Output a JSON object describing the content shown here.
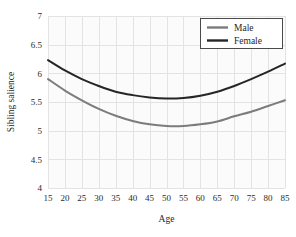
{
  "chart_data": {
    "type": "line",
    "title": "",
    "xlabel": "Age",
    "ylabel": "Sibling salience",
    "xlim": [
      15,
      85
    ],
    "ylim": [
      4,
      7
    ],
    "xticks": [
      15,
      20,
      25,
      30,
      35,
      40,
      45,
      50,
      55,
      60,
      65,
      70,
      75,
      80,
      85
    ],
    "xticklabels": [
      "15",
      "20",
      "25",
      "30",
      "35",
      "40",
      "45",
      "50",
      "55",
      "60",
      "65",
      "70",
      "75",
      "80",
      "85"
    ],
    "yticks": [
      4,
      4.5,
      5,
      5.5,
      6,
      6.5,
      7
    ],
    "yticklabels": [
      "4",
      "4.5",
      "5",
      "5.5",
      "6",
      "6.5",
      "7"
    ],
    "grid": true,
    "legend_position": "top-right",
    "x": [
      15,
      20,
      25,
      30,
      35,
      40,
      45,
      50,
      55,
      60,
      65,
      70,
      75,
      80,
      85
    ],
    "series": [
      {
        "name": "Male",
        "color": "#7c7c7c",
        "values": [
          5.9,
          5.7,
          5.53,
          5.38,
          5.26,
          5.17,
          5.11,
          5.08,
          5.08,
          5.11,
          5.16,
          5.25,
          5.33,
          5.43,
          5.53
        ]
      },
      {
        "name": "Female",
        "color": "#262626",
        "values": [
          6.23,
          6.05,
          5.9,
          5.78,
          5.68,
          5.62,
          5.58,
          5.56,
          5.57,
          5.61,
          5.68,
          5.78,
          5.9,
          6.03,
          6.17
        ]
      }
    ]
  },
  "axes": {
    "x_title": "Age",
    "y_title": "Sibling salience"
  },
  "legend": {
    "entries": [
      {
        "label": "Male",
        "color": "#7c7c7c"
      },
      {
        "label": "Female",
        "color": "#262626"
      }
    ]
  },
  "colors": {
    "male_line": "#7c7c7c",
    "female_line": "#262626",
    "grid": "#e3e3e3",
    "plot_background": "#fbfbfb",
    "text": "#1f1f1f"
  }
}
